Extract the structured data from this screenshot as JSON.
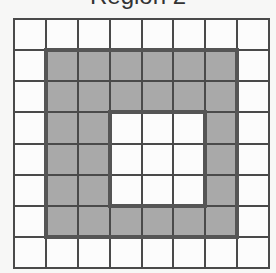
{
  "title": "Region 2",
  "grid": {
    "rows": 8,
    "cols": 8,
    "shaded_color": "#a9a9a9",
    "empty_color": "#fcfcfc",
    "line_color": "#4a4a4a",
    "shaded_region": {
      "outer": {
        "row_start": 1,
        "row_end": 6,
        "col_start": 1,
        "col_end": 6
      },
      "hole": {
        "row_start": 3,
        "row_end": 5,
        "col_start": 3,
        "col_end": 5
      }
    }
  }
}
